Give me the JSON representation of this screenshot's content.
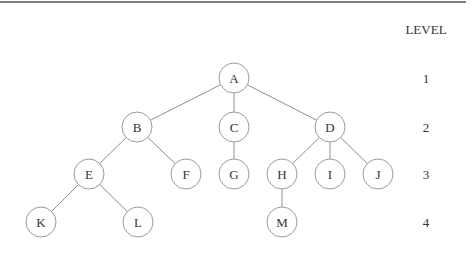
{
  "diagram": {
    "type": "tree",
    "level_header": "LEVEL",
    "levels": [
      {
        "label": "1",
        "y": 78
      },
      {
        "label": "2",
        "y": 127
      },
      {
        "label": "3",
        "y": 174
      },
      {
        "label": "4",
        "y": 222
      }
    ],
    "node_radius": 15,
    "nodes": [
      {
        "id": "A",
        "label": "A",
        "x": 234,
        "y": 78,
        "level": 1
      },
      {
        "id": "B",
        "label": "B",
        "x": 137,
        "y": 127,
        "level": 2
      },
      {
        "id": "C",
        "label": "C",
        "x": 234,
        "y": 127,
        "level": 2
      },
      {
        "id": "D",
        "label": "D",
        "x": 330,
        "y": 127,
        "level": 2
      },
      {
        "id": "E",
        "label": "E",
        "x": 89,
        "y": 174,
        "level": 3
      },
      {
        "id": "F",
        "label": "F",
        "x": 186,
        "y": 174,
        "level": 3
      },
      {
        "id": "G",
        "label": "G",
        "x": 234,
        "y": 174,
        "level": 3
      },
      {
        "id": "H",
        "label": "H",
        "x": 282,
        "y": 174,
        "level": 3
      },
      {
        "id": "I",
        "label": "I",
        "x": 330,
        "y": 174,
        "level": 3
      },
      {
        "id": "J",
        "label": "J",
        "x": 378,
        "y": 174,
        "level": 3
      },
      {
        "id": "K",
        "label": "K",
        "x": 41,
        "y": 222,
        "level": 4
      },
      {
        "id": "L",
        "label": "L",
        "x": 138,
        "y": 222,
        "level": 4
      },
      {
        "id": "M",
        "label": "M",
        "x": 282,
        "y": 222,
        "level": 4
      }
    ],
    "edges": [
      [
        "A",
        "B"
      ],
      [
        "A",
        "C"
      ],
      [
        "A",
        "D"
      ],
      [
        "B",
        "E"
      ],
      [
        "B",
        "F"
      ],
      [
        "C",
        "G"
      ],
      [
        "D",
        "H"
      ],
      [
        "D",
        "I"
      ],
      [
        "D",
        "J"
      ],
      [
        "E",
        "K"
      ],
      [
        "E",
        "L"
      ],
      [
        "H",
        "M"
      ]
    ]
  }
}
